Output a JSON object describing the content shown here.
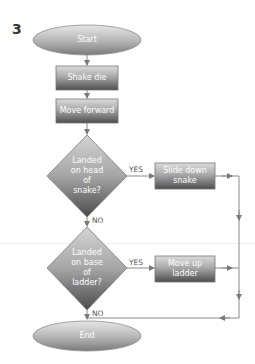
{
  "figure": {
    "number": "3",
    "type": "flowchart"
  },
  "colors": {
    "node_light": "#d9d9d9",
    "node_dark": "#5a5a5a",
    "line": "#8a8a8a",
    "text_on_node": "#ffffff",
    "edge_label": "#555555"
  },
  "nodes": {
    "start": {
      "shape": "terminal",
      "label": "Start"
    },
    "shake_die": {
      "shape": "process",
      "label": "Shake die"
    },
    "move_forward": {
      "shape": "process",
      "label": "Move forward"
    },
    "snake_decision": {
      "shape": "decision",
      "label_lines": [
        "Landed",
        "on head",
        "of",
        "snake?"
      ]
    },
    "slide_down": {
      "shape": "process",
      "label_lines": [
        "Slide down",
        "snake"
      ]
    },
    "ladder_decision": {
      "shape": "decision",
      "label_lines": [
        "Landed",
        "on base",
        "of",
        "ladder?"
      ]
    },
    "move_up": {
      "shape": "process",
      "label_lines": [
        "Move up",
        "ladder"
      ]
    },
    "end": {
      "shape": "terminal",
      "label": "End"
    }
  },
  "edges": {
    "snake_yes": "YES",
    "snake_no": "NO",
    "ladder_yes": "YES",
    "ladder_no": "NO"
  }
}
